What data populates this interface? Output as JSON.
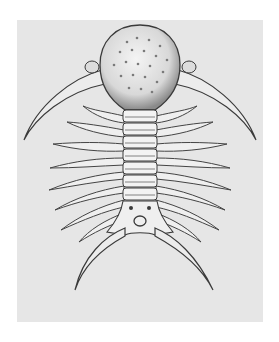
{
  "image": {
    "subject": "engraved illustration of a spiny trilobite fossil",
    "style": "grayscale engraving",
    "colors": {
      "page_background": "#ffffff",
      "plate_background": "#e6e6e6",
      "ink": "#3a3a3a",
      "shell_fill": "#f2f2f2"
    }
  }
}
